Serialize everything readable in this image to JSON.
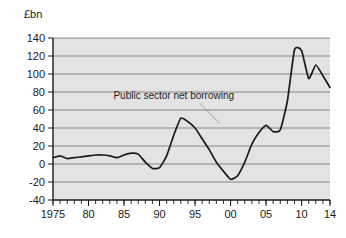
{
  "chart_data": {
    "type": "line",
    "title": "",
    "subtitle": "",
    "unit_label": "£bn",
    "xlabel": "",
    "ylabel": "",
    "ylim": [
      -40,
      140
    ],
    "xlim": [
      1975,
      2014
    ],
    "grid": true,
    "legend_position": "none",
    "y_ticks": [
      140,
      120,
      100,
      80,
      60,
      40,
      20,
      0,
      -20,
      -40
    ],
    "y_tick_labels": [
      "140",
      "120",
      "100",
      "80",
      "60",
      "40",
      "20",
      "0",
      "-20",
      "-40"
    ],
    "x_ticks": [
      1975,
      1980,
      1985,
      1990,
      1995,
      2000,
      2005,
      2010,
      2014
    ],
    "x_tick_labels": [
      "1975",
      "80",
      "85",
      "90",
      "95",
      "00",
      "05",
      "10",
      "14"
    ],
    "x_minor_tick_interval": 1,
    "annotations": [
      {
        "text": "Public sector net borrowing",
        "x": 1992.0,
        "y": 72,
        "leader_to_x": 1998.5,
        "leader_to_y": 45
      }
    ],
    "series": [
      {
        "name": "Public sector net borrowing",
        "color": "#1a1a1a",
        "x": [
          1975,
          1976,
          1977,
          1978,
          1979,
          1980,
          1981,
          1982,
          1983,
          1984,
          1985,
          1986,
          1987,
          1988,
          1989,
          1990,
          1991,
          1992,
          1993,
          1994,
          1995,
          1996,
          1997,
          1998,
          1999,
          2000,
          2001,
          2002,
          2003,
          2004,
          2005,
          2006,
          2007,
          2008,
          2009,
          2010,
          2011,
          2012,
          2013,
          2014
        ],
        "values": [
          7,
          9,
          6,
          7,
          8,
          9,
          10,
          10,
          9,
          7,
          10,
          12,
          11,
          2,
          -5,
          -4,
          9,
          32,
          51,
          47,
          40,
          28,
          16,
          2,
          -8,
          -17,
          -13,
          2,
          22,
          35,
          43,
          36,
          38,
          70,
          127,
          126,
          95,
          110,
          98,
          85
        ],
        "notes": {
          "peak_1993": 51,
          "trough_2000": -17,
          "peak_2009": 127,
          "secondary_peak_2012": 110,
          "end_value_2014": 85
        }
      }
    ]
  }
}
